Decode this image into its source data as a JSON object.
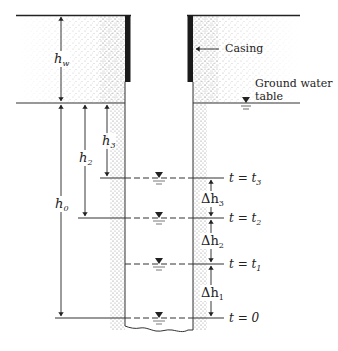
{
  "figure": {
    "type": "borehole falling-head / rising water level diagram",
    "labels": {
      "casing": "Casing",
      "ground_water_line1": "Ground water",
      "ground_water_line2": "table",
      "hw": "h",
      "hw_sub": "w",
      "h0": "h",
      "h0_sub": "0",
      "h2": "h",
      "h2_sub": "2",
      "h3": "h",
      "h3_sub": "3",
      "dh3": "Δh",
      "dh3_sub": "3",
      "dh2": "Δh",
      "dh2_sub": "2",
      "dh1": "Δh",
      "dh1_sub": "1"
    },
    "time_levels": [
      {
        "label": "t = t",
        "sub": "3",
        "y": 178
      },
      {
        "label": "t = t",
        "sub": "2",
        "y": 218
      },
      {
        "label": "t = t",
        "sub": "1",
        "y": 264
      },
      {
        "label": "t = 0",
        "sub": "",
        "y": 318
      }
    ],
    "colors": {
      "line": "#333333",
      "casing": "#1a1a1a",
      "soil_dots": "#555555",
      "background": "#ffffff"
    }
  }
}
